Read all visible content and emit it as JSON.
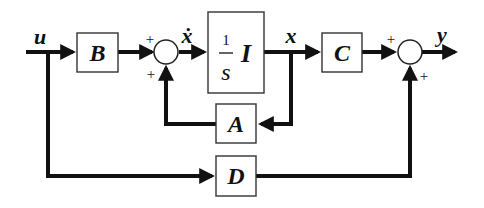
{
  "diagram": {
    "type": "state-space block diagram",
    "signals": {
      "input": "u",
      "state_derivative": "ẋ",
      "state": "x",
      "output": "y"
    },
    "blocks": {
      "B": {
        "label": "B"
      },
      "integrator": {
        "numerator": "1",
        "denominator": "s",
        "matrix": "I"
      },
      "C": {
        "label": "C"
      },
      "A": {
        "label": "A"
      },
      "D": {
        "label": "D"
      }
    },
    "junctions": {
      "sum1": {
        "top_sign": "+",
        "bottom_sign": "+"
      },
      "sum2": {
        "top_sign": "+",
        "bottom_sign": "+"
      }
    },
    "colors": {
      "stroke": "#111111",
      "background": "#ffffff"
    }
  }
}
